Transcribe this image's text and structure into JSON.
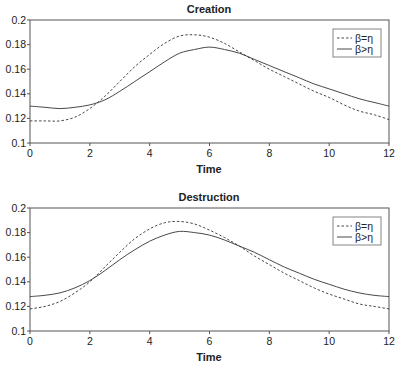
{
  "chart_data": [
    {
      "type": "line",
      "title": "Creation",
      "xlabel": "Time",
      "ylabel": "",
      "xlim": [
        0,
        12
      ],
      "ylim": [
        0.1,
        0.2
      ],
      "xticks": [
        "0",
        "2",
        "4",
        "6",
        "8",
        "10",
        "12"
      ],
      "yticks": [
        "0.1",
        "0.12",
        "0.14",
        "0.16",
        "0.18",
        "0.2"
      ],
      "grid": false,
      "legend_position": "upper right",
      "x": [
        0,
        0.5,
        1,
        1.5,
        2,
        2.5,
        3,
        3.5,
        4,
        4.5,
        5,
        5.5,
        6,
        6.5,
        7,
        7.5,
        8,
        8.5,
        9,
        9.5,
        10,
        10.5,
        11,
        11.5,
        12
      ],
      "series": [
        {
          "name": "β=η",
          "style": "dashed",
          "values": [
            0.118,
            0.118,
            0.118,
            0.121,
            0.128,
            0.138,
            0.15,
            0.162,
            0.172,
            0.181,
            0.187,
            0.188,
            0.186,
            0.181,
            0.174,
            0.167,
            0.16,
            0.154,
            0.148,
            0.142,
            0.137,
            0.131,
            0.126,
            0.123,
            0.119
          ]
        },
        {
          "name": "β>η",
          "style": "solid",
          "values": [
            0.13,
            0.129,
            0.128,
            0.129,
            0.131,
            0.135,
            0.142,
            0.15,
            0.158,
            0.166,
            0.173,
            0.176,
            0.178,
            0.176,
            0.173,
            0.168,
            0.163,
            0.158,
            0.153,
            0.148,
            0.144,
            0.14,
            0.136,
            0.133,
            0.13
          ]
        }
      ]
    },
    {
      "type": "line",
      "title": "Destruction",
      "xlabel": "Time",
      "ylabel": "",
      "xlim": [
        0,
        12
      ],
      "ylim": [
        0.1,
        0.2
      ],
      "xticks": [
        "0",
        "2",
        "4",
        "6",
        "8",
        "10",
        "12"
      ],
      "yticks": [
        "0.1",
        "0.12",
        "0.14",
        "0.16",
        "0.18",
        "0.2"
      ],
      "grid": false,
      "legend_position": "upper right",
      "x": [
        0,
        0.5,
        1,
        1.5,
        2,
        2.5,
        3,
        3.5,
        4,
        4.5,
        5,
        5.5,
        6,
        6.5,
        7,
        7.5,
        8,
        8.5,
        9,
        9.5,
        10,
        10.5,
        11,
        11.5,
        12
      ],
      "series": [
        {
          "name": "β=η",
          "style": "dashed",
          "values": [
            0.118,
            0.12,
            0.124,
            0.131,
            0.14,
            0.152,
            0.164,
            0.175,
            0.183,
            0.188,
            0.189,
            0.187,
            0.182,
            0.176,
            0.169,
            0.161,
            0.154,
            0.147,
            0.141,
            0.135,
            0.13,
            0.126,
            0.122,
            0.12,
            0.118
          ]
        },
        {
          "name": "β>η",
          "style": "solid",
          "values": [
            0.128,
            0.129,
            0.131,
            0.135,
            0.141,
            0.149,
            0.158,
            0.166,
            0.173,
            0.178,
            0.181,
            0.18,
            0.178,
            0.174,
            0.169,
            0.164,
            0.158,
            0.152,
            0.147,
            0.142,
            0.138,
            0.134,
            0.131,
            0.129,
            0.128
          ]
        }
      ]
    }
  ],
  "style": {
    "axis_color": "#555555",
    "line_color": "#333333",
    "text_color": "#222222"
  }
}
